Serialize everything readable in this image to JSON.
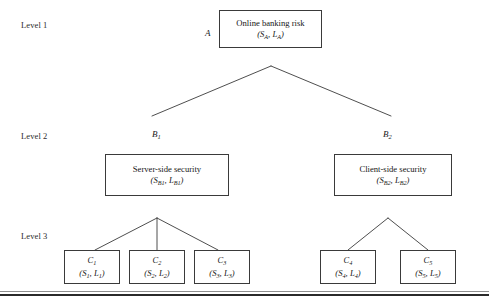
{
  "figure": {
    "background": "#ffffff",
    "line_color": "#3a3a3a",
    "text_color": "#1a1a1a"
  },
  "levels": [
    {
      "id": "level-1",
      "label": "Level 1"
    },
    {
      "id": "level-2",
      "label": "Level 2"
    },
    {
      "id": "level-3",
      "label": "Level 3"
    }
  ],
  "nodes": {
    "root": {
      "tag": "A",
      "tag_sub": "",
      "title": "Online banking risk",
      "pair_open": "(S",
      "pair_s_sub": "A",
      "pair_mid": ", L",
      "pair_l_sub": "A",
      "pair_close": ")"
    },
    "b1": {
      "tag": "B",
      "tag_sub": "1",
      "title": "Server-side security",
      "pair_open": "(S",
      "pair_s_sub": "B1",
      "pair_mid": ", L",
      "pair_l_sub": "B1",
      "pair_close": ")"
    },
    "b2": {
      "tag": "B",
      "tag_sub": "2",
      "title": "Client-side security",
      "pair_open": "(S",
      "pair_s_sub": "B2",
      "pair_mid": ", L",
      "pair_l_sub": "B2",
      "pair_close": ")"
    },
    "c1": {
      "tag": "C",
      "tag_sub": "1",
      "pair_open": "(S",
      "pair_s_sub": "1",
      "pair_mid": ", L",
      "pair_l_sub": "1",
      "pair_close": ")"
    },
    "c2": {
      "tag": "C",
      "tag_sub": "2",
      "pair_open": "(S",
      "pair_s_sub": "2",
      "pair_mid": ", L",
      "pair_l_sub": "2",
      "pair_close": ")"
    },
    "c3": {
      "tag": "C",
      "tag_sub": "3",
      "pair_open": "(S",
      "pair_s_sub": "3",
      "pair_mid": ", L",
      "pair_l_sub": "3",
      "pair_close": ")"
    },
    "c4": {
      "tag": "C",
      "tag_sub": "4",
      "pair_open": "(S",
      "pair_s_sub": "4",
      "pair_mid": ", L",
      "pair_l_sub": "4",
      "pair_close": ")"
    },
    "c5": {
      "tag": "C",
      "tag_sub": "5",
      "pair_open": "(S",
      "pair_s_sub": "5",
      "pair_mid": ", L",
      "pair_l_sub": "5",
      "pair_close": ")"
    }
  }
}
